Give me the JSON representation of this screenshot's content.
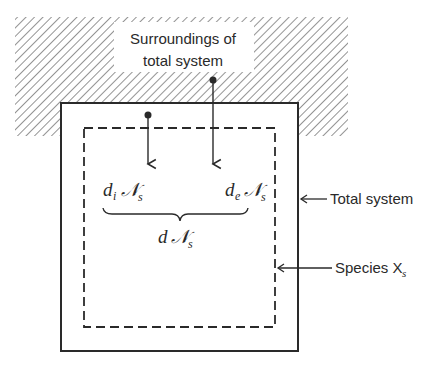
{
  "diagram": {
    "surroundings_label": {
      "line1": "Surroundings of",
      "line2": "total system"
    },
    "total_system_label": "Total system",
    "species_label": {
      "text": "Species X",
      "subscript": "s"
    },
    "terms": {
      "internal": {
        "d": "d",
        "sub": "i",
        "symbol": "𝒩",
        "symbol_sub": "s"
      },
      "external": {
        "d": "d",
        "sub": "e",
        "symbol": "𝒩",
        "symbol_sub": "s"
      },
      "total": {
        "d": "d",
        "symbol": "𝒩",
        "symbol_sub": "s"
      }
    },
    "colors": {
      "ink": "#2a2a2a",
      "background": "#ffffff"
    }
  }
}
